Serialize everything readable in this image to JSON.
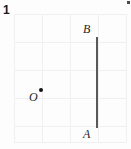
{
  "figure": {
    "problem_number": "1",
    "width": 131,
    "height": 149,
    "background_color": "#fdfdfd",
    "grid": {
      "line_color": "#f0f0f0",
      "left": 14,
      "top": 14,
      "cell_size": 28,
      "columns": 4,
      "rows": 4,
      "vertical_x": [
        14,
        42,
        70,
        98,
        126
      ],
      "horizontal_y": [
        14,
        42,
        70,
        98,
        126,
        142
      ]
    },
    "segment": {
      "name": "AB",
      "color": "#595959",
      "thickness": 2,
      "x": 96,
      "y_top": 37,
      "y_bottom": 128
    },
    "point_o": {
      "dot_color": "#111111",
      "dot_x": 39,
      "dot_y": 88,
      "dot_size": 4
    },
    "labels": {
      "a": "A",
      "b": "B",
      "o": "O"
    },
    "label_positions": {
      "a_x": 83,
      "a_y": 128,
      "b_x": 83,
      "b_y": 23,
      "o_x": 29,
      "o_y": 91
    },
    "speck": {
      "color": "#4a4a4a",
      "x": 127,
      "y": 1
    }
  }
}
